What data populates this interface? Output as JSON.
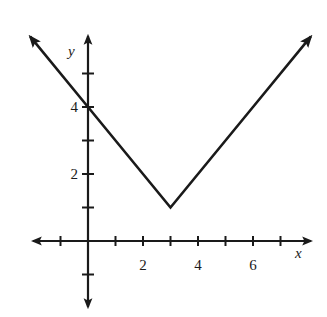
{
  "chart_data": {
    "type": "line",
    "title": "",
    "function": "y = |x - 3| + 1",
    "xlabel": "x",
    "ylabel": "y",
    "xlim": [
      -2,
      8
    ],
    "ylim": [
      -2,
      6
    ],
    "grid": false,
    "legend": null,
    "x_tick_labels": [
      "2",
      "4",
      "6"
    ],
    "x_ticks": [
      -1,
      1,
      2,
      3,
      4,
      5,
      6,
      7
    ],
    "y_tick_labels": [
      "2",
      "4"
    ],
    "y_ticks": [
      -1,
      1,
      2,
      3,
      4,
      5
    ],
    "series": [
      {
        "name": "y = |x - 3| + 1",
        "x": [
          -2.1,
          0,
          3,
          6,
          8.1
        ],
        "y": [
          6.1,
          4,
          1,
          4,
          6.1
        ],
        "arrows_at_ends": true
      }
    ],
    "key_points": [
      {
        "label": "vertex",
        "x": 3,
        "y": 1
      },
      {
        "label": "y-intercept",
        "x": 0,
        "y": 4
      }
    ]
  },
  "colors": {
    "ink": "#1a1a1a",
    "background": "#ffffff"
  }
}
